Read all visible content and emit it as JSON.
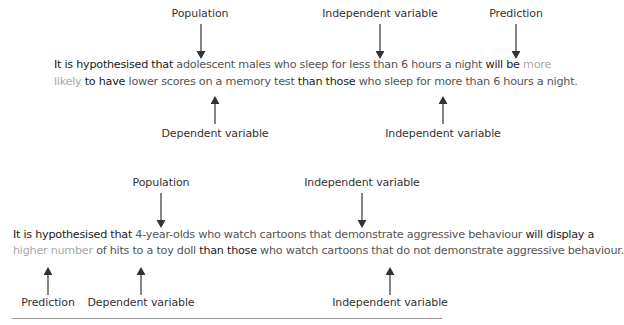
{
  "diagram1": {
    "labels": {
      "population": "Population",
      "independent_top": "Independent variable",
      "prediction": "Prediction",
      "dependent": "Dependent variable",
      "independent_bottom": "Independent variable"
    },
    "line1": [
      {
        "text": "It is hypothesised that ",
        "tone": "dark"
      },
      {
        "text": "adolescent males",
        "tone": "mid"
      },
      {
        "text": " who sleep for less than 6 hours a night",
        "tone": "mid"
      },
      {
        "text": " will be ",
        "tone": "dark"
      },
      {
        "text": "more",
        "tone": "light"
      }
    ],
    "line2": [
      {
        "text": "likely",
        "tone": "light"
      },
      {
        "text": " to have ",
        "tone": "dark"
      },
      {
        "text": "lower scores on a memory test",
        "tone": "mid"
      },
      {
        "text": " than those ",
        "tone": "dark"
      },
      {
        "text": "who sleep for more than 6 hours a night.",
        "tone": "mid"
      }
    ]
  },
  "diagram2": {
    "labels": {
      "population": "Population",
      "independent_top": "Independent variable",
      "prediction": "Prediction",
      "dependent": "Dependent variable",
      "independent_bottom": "Independent variable"
    },
    "line1": [
      {
        "text": "It is hypothesised that ",
        "tone": "dark"
      },
      {
        "text": "4-year-olds",
        "tone": "mid"
      },
      {
        "text": " who watch cartoons that demonstrate aggressive behaviour",
        "tone": "mid"
      },
      {
        "text": " will display a",
        "tone": "dark"
      }
    ],
    "line2": [
      {
        "text": "higher number",
        "tone": "light"
      },
      {
        "text": " of hits to a toy doll",
        "tone": "mid"
      },
      {
        "text": " than those ",
        "tone": "dark"
      },
      {
        "text": "who watch cartoons that do not demonstrate aggressive behaviour.",
        "tone": "mid"
      }
    ]
  },
  "colors": {
    "dark_text": "#222222",
    "mid_text": "#555555",
    "light_text": "#a9a9a9",
    "rule": "#9a9a9a"
  }
}
